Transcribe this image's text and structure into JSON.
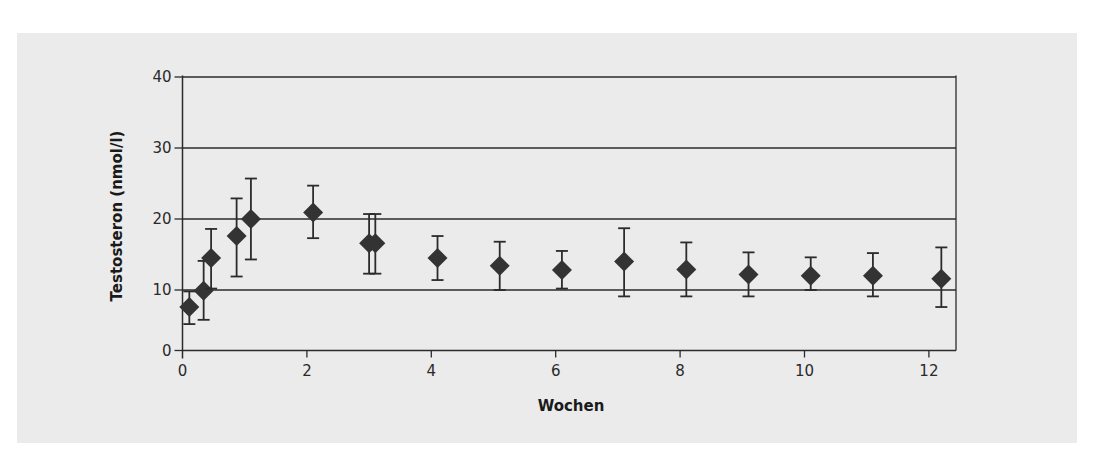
{
  "figure": {
    "panel_color": "#ebebeb",
    "line_color": "#2b2b2b",
    "marker_color": "#333333"
  },
  "chart_data": {
    "type": "scatter",
    "title": "",
    "xlabel": "Wochen",
    "ylabel": "Testosteron (nmol/l)",
    "xlim": [
      0,
      12.45
    ],
    "ylim": [
      0,
      40
    ],
    "x_ticks": [
      0,
      2,
      4,
      6,
      8,
      10,
      12
    ],
    "y_ticks": [
      0,
      10,
      20,
      30,
      40
    ],
    "grid": "horizontal",
    "legend": null,
    "marker": "diamond",
    "error_bars": true,
    "series": [
      {
        "name": "Testosteron",
        "points": [
          {
            "x": 0.11,
            "y": 7.6,
            "lower": 5.2,
            "upper": 9.8
          },
          {
            "x": 0.34,
            "y": 9.9,
            "lower": 5.8,
            "upper": 14.1
          },
          {
            "x": 0.46,
            "y": 14.5,
            "lower": 10.2,
            "upper": 18.6
          },
          {
            "x": 0.87,
            "y": 17.6,
            "lower": 11.9,
            "upper": 22.9
          },
          {
            "x": 1.1,
            "y": 20.0,
            "lower": 14.3,
            "upper": 25.7
          },
          {
            "x": 2.1,
            "y": 20.9,
            "lower": 17.3,
            "upper": 24.7
          },
          {
            "x": 3.0,
            "y": 16.6,
            "lower": 12.3,
            "upper": 20.7
          },
          {
            "x": 3.1,
            "y": 16.6,
            "lower": 12.3,
            "upper": 20.7
          },
          {
            "x": 4.1,
            "y": 14.5,
            "lower": 11.4,
            "upper": 17.6
          },
          {
            "x": 5.1,
            "y": 13.4,
            "lower": 10.0,
            "upper": 16.8
          },
          {
            "x": 6.1,
            "y": 12.8,
            "lower": 10.2,
            "upper": 15.5
          },
          {
            "x": 7.1,
            "y": 14.0,
            "lower": 9.1,
            "upper": 18.7
          },
          {
            "x": 8.1,
            "y": 12.9,
            "lower": 9.1,
            "upper": 16.7
          },
          {
            "x": 9.1,
            "y": 12.2,
            "lower": 9.1,
            "upper": 15.3
          },
          {
            "x": 10.1,
            "y": 12.0,
            "lower": 10.0,
            "upper": 14.6
          },
          {
            "x": 11.1,
            "y": 12.0,
            "lower": 9.1,
            "upper": 15.2
          },
          {
            "x": 12.2,
            "y": 11.6,
            "lower": 7.6,
            "upper": 16.0
          }
        ]
      }
    ]
  }
}
